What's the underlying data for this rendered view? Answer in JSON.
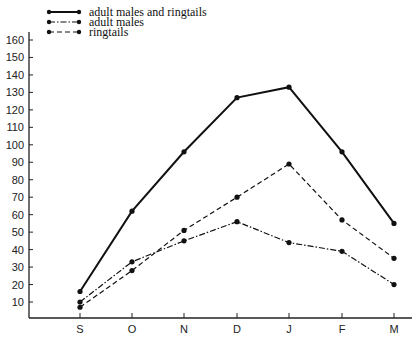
{
  "chart_data": {
    "type": "line",
    "title": "",
    "xlabel": "",
    "ylabel": "",
    "categories": [
      "S",
      "O",
      "N",
      "D",
      "J",
      "F",
      "M"
    ],
    "ylim": [
      0,
      160
    ],
    "yticks": [
      10,
      20,
      30,
      40,
      50,
      60,
      70,
      80,
      90,
      100,
      110,
      120,
      130,
      140,
      150,
      160
    ],
    "grid": false,
    "legend_position": "top-left",
    "series": [
      {
        "name": "adult males and ringtails",
        "style": "solid",
        "values": [
          16,
          62,
          96,
          127,
          133,
          96,
          55
        ]
      },
      {
        "name": "adult males",
        "style": "dash-dot",
        "values": [
          10,
          33,
          45,
          56,
          44,
          39,
          20
        ]
      },
      {
        "name": "ringtails",
        "style": "dashed",
        "values": [
          7,
          28,
          51,
          70,
          89,
          57,
          35
        ]
      }
    ]
  },
  "legend": {
    "items": [
      {
        "label": "adult males and ringtails"
      },
      {
        "label": "adult males"
      },
      {
        "label": "ringtails"
      }
    ]
  },
  "colors": {
    "line": "#111111",
    "axis": "#222222",
    "background": "#ffffff"
  }
}
